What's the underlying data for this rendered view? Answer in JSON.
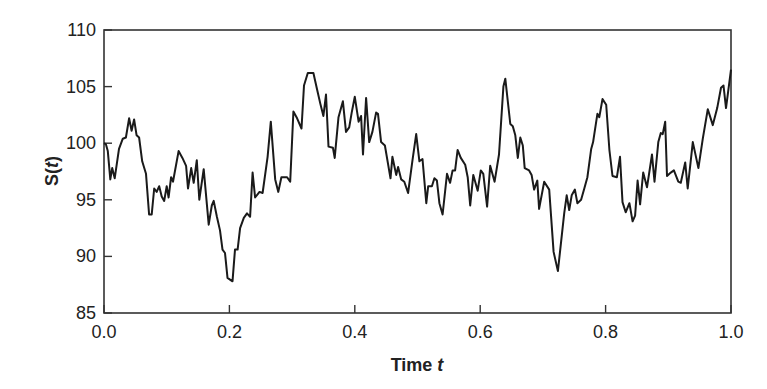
{
  "chart_data": {
    "type": "line",
    "title": "",
    "xlabel": "Time t",
    "xlabel_main": "Time ",
    "xlabel_var": "t",
    "ylabel": "S(t)",
    "ylabel_prefix": "S(",
    "ylabel_var": "t",
    "ylabel_suffix": ")",
    "xlim": [
      0.0,
      1.0
    ],
    "ylim": [
      85,
      110
    ],
    "xticks": [
      "0.0",
      "0.2",
      "0.4",
      "0.6",
      "0.8",
      "1.0"
    ],
    "yticks": [
      "85",
      "90",
      "95",
      "100",
      "105",
      "110"
    ],
    "grid": false,
    "legend": null,
    "line_color": "#1a1a1a",
    "series": [
      {
        "name": "S(t)",
        "points": [
          [
            0.003,
            99.9
          ],
          [
            0.006,
            99.3
          ],
          [
            0.01,
            96.8
          ],
          [
            0.013,
            97.8
          ],
          [
            0.017,
            96.9
          ],
          [
            0.024,
            99.5
          ],
          [
            0.03,
            100.4
          ],
          [
            0.035,
            100.5
          ],
          [
            0.04,
            102.2
          ],
          [
            0.044,
            101.1
          ],
          [
            0.048,
            102.1
          ],
          [
            0.052,
            100.7
          ],
          [
            0.056,
            100.5
          ],
          [
            0.061,
            98.4
          ],
          [
            0.067,
            97.3
          ],
          [
            0.072,
            93.7
          ],
          [
            0.076,
            93.7
          ],
          [
            0.08,
            96.0
          ],
          [
            0.084,
            95.7
          ],
          [
            0.088,
            96.2
          ],
          [
            0.092,
            95.3
          ],
          [
            0.096,
            94.9
          ],
          [
            0.1,
            96.2
          ],
          [
            0.103,
            95.2
          ],
          [
            0.107,
            97.0
          ],
          [
            0.11,
            96.6
          ],
          [
            0.119,
            99.3
          ],
          [
            0.125,
            98.7
          ],
          [
            0.131,
            98.0
          ],
          [
            0.134,
            96.0
          ],
          [
            0.139,
            97.8
          ],
          [
            0.143,
            96.5
          ],
          [
            0.148,
            98.5
          ],
          [
            0.152,
            95.0
          ],
          [
            0.159,
            97.7
          ],
          [
            0.167,
            92.8
          ],
          [
            0.172,
            94.5
          ],
          [
            0.175,
            94.9
          ],
          [
            0.18,
            93.5
          ],
          [
            0.185,
            92.3
          ],
          [
            0.189,
            90.6
          ],
          [
            0.193,
            90.3
          ],
          [
            0.197,
            88.1
          ],
          [
            0.205,
            87.8
          ],
          [
            0.209,
            90.6
          ],
          [
            0.213,
            90.6
          ],
          [
            0.217,
            92.5
          ],
          [
            0.223,
            93.4
          ],
          [
            0.228,
            93.8
          ],
          [
            0.233,
            93.5
          ],
          [
            0.237,
            97.4
          ],
          [
            0.241,
            95.2
          ],
          [
            0.248,
            95.7
          ],
          [
            0.253,
            95.6
          ],
          [
            0.261,
            98.8
          ],
          [
            0.266,
            101.9
          ],
          [
            0.273,
            96.8
          ],
          [
            0.278,
            95.7
          ],
          [
            0.283,
            97.0
          ],
          [
            0.292,
            97.0
          ],
          [
            0.297,
            96.6
          ],
          [
            0.302,
            102.8
          ],
          [
            0.308,
            102.2
          ],
          [
            0.315,
            101.3
          ],
          [
            0.319,
            105.1
          ],
          [
            0.325,
            106.2
          ],
          [
            0.334,
            106.2
          ],
          [
            0.34,
            104.7
          ],
          [
            0.345,
            103.5
          ],
          [
            0.35,
            102.4
          ],
          [
            0.354,
            104.3
          ],
          [
            0.358,
            99.7
          ],
          [
            0.365,
            99.6
          ],
          [
            0.368,
            98.7
          ],
          [
            0.374,
            102.3
          ],
          [
            0.381,
            103.7
          ],
          [
            0.386,
            101.0
          ],
          [
            0.391,
            101.4
          ],
          [
            0.395,
            102.7
          ],
          [
            0.4,
            104.1
          ],
          [
            0.406,
            101.9
          ],
          [
            0.41,
            102.4
          ],
          [
            0.413,
            99.0
          ],
          [
            0.418,
            104.0
          ],
          [
            0.423,
            100.1
          ],
          [
            0.428,
            101.0
          ],
          [
            0.434,
            102.7
          ],
          [
            0.437,
            102.6
          ],
          [
            0.442,
            100.1
          ],
          [
            0.448,
            99.8
          ],
          [
            0.457,
            96.9
          ],
          [
            0.46,
            98.8
          ],
          [
            0.466,
            97.2
          ],
          [
            0.469,
            97.9
          ],
          [
            0.474,
            96.8
          ],
          [
            0.479,
            96.6
          ],
          [
            0.485,
            95.6
          ],
          [
            0.492,
            98.5
          ],
          [
            0.498,
            100.8
          ],
          [
            0.503,
            98.4
          ],
          [
            0.508,
            98.6
          ],
          [
            0.514,
            94.7
          ],
          [
            0.517,
            96.2
          ],
          [
            0.523,
            96.2
          ],
          [
            0.527,
            96.9
          ],
          [
            0.531,
            96.7
          ],
          [
            0.535,
            94.7
          ],
          [
            0.54,
            93.7
          ],
          [
            0.547,
            97.3
          ],
          [
            0.552,
            96.5
          ],
          [
            0.556,
            97.6
          ],
          [
            0.56,
            97.6
          ],
          [
            0.564,
            99.4
          ],
          [
            0.569,
            98.7
          ],
          [
            0.576,
            98.1
          ],
          [
            0.58,
            97.0
          ],
          [
            0.584,
            94.5
          ],
          [
            0.589,
            97.2
          ],
          [
            0.596,
            95.8
          ],
          [
            0.601,
            97.6
          ],
          [
            0.605,
            97.3
          ],
          [
            0.611,
            94.4
          ],
          [
            0.616,
            98.0
          ],
          [
            0.623,
            96.6
          ],
          [
            0.63,
            99.0
          ],
          [
            0.637,
            105.0
          ],
          [
            0.64,
            105.7
          ],
          [
            0.648,
            101.7
          ],
          [
            0.652,
            101.5
          ],
          [
            0.656,
            100.7
          ],
          [
            0.66,
            98.7
          ],
          [
            0.664,
            100.5
          ],
          [
            0.668,
            99.8
          ],
          [
            0.671,
            97.8
          ],
          [
            0.678,
            97.6
          ],
          [
            0.682,
            97.2
          ],
          [
            0.686,
            95.9
          ],
          [
            0.691,
            96.7
          ],
          [
            0.694,
            94.2
          ],
          [
            0.702,
            96.6
          ],
          [
            0.71,
            95.9
          ],
          [
            0.717,
            90.4
          ],
          [
            0.724,
            88.7
          ],
          [
            0.734,
            93.8
          ],
          [
            0.738,
            95.4
          ],
          [
            0.742,
            94.1
          ],
          [
            0.746,
            95.4
          ],
          [
            0.751,
            95.9
          ],
          [
            0.755,
            94.7
          ],
          [
            0.761,
            95.0
          ],
          [
            0.766,
            96.0
          ],
          [
            0.771,
            97.0
          ],
          [
            0.777,
            99.5
          ],
          [
            0.78,
            100.1
          ],
          [
            0.787,
            102.6
          ],
          [
            0.79,
            102.3
          ],
          [
            0.795,
            103.9
          ],
          [
            0.801,
            103.4
          ],
          [
            0.806,
            99.4
          ],
          [
            0.811,
            97.1
          ],
          [
            0.818,
            97.0
          ],
          [
            0.823,
            98.8
          ],
          [
            0.827,
            94.8
          ],
          [
            0.832,
            93.9
          ],
          [
            0.838,
            94.7
          ],
          [
            0.843,
            93.1
          ],
          [
            0.847,
            93.6
          ],
          [
            0.851,
            96.7
          ],
          [
            0.855,
            94.6
          ],
          [
            0.86,
            97.4
          ],
          [
            0.866,
            96.1
          ],
          [
            0.874,
            99.0
          ],
          [
            0.878,
            96.6
          ],
          [
            0.884,
            100.1
          ],
          [
            0.888,
            100.9
          ],
          [
            0.891,
            100.8
          ],
          [
            0.895,
            101.9
          ],
          [
            0.898,
            97.1
          ],
          [
            0.904,
            97.4
          ],
          [
            0.909,
            97.6
          ],
          [
            0.916,
            96.6
          ],
          [
            0.92,
            96.5
          ],
          [
            0.927,
            98.3
          ],
          [
            0.931,
            96.0
          ],
          [
            0.939,
            100.1
          ],
          [
            0.948,
            97.8
          ],
          [
            0.955,
            100.4
          ],
          [
            0.963,
            103.0
          ],
          [
            0.971,
            101.6
          ],
          [
            0.978,
            103.1
          ],
          [
            0.984,
            104.9
          ],
          [
            0.988,
            105.1
          ],
          [
            0.992,
            103.1
          ],
          [
            1.0,
            106.5
          ]
        ]
      }
    ]
  }
}
